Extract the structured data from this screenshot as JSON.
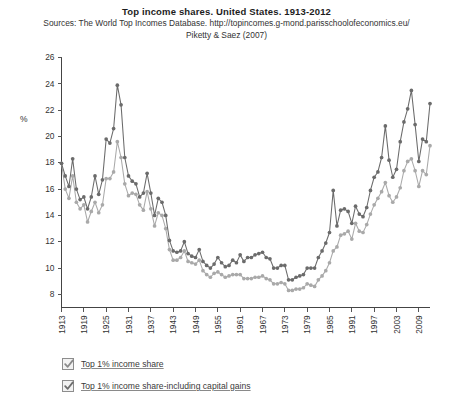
{
  "chart_data": {
    "type": "line",
    "title": "Top income shares. United States. 1913-2012",
    "subtitle_line1": "Sources: The World Top Incomes Database. http://topincomes.g-mond.parisschoolofeconomics.eu/",
    "subtitle_line2": "Piketty & Saez (2007)",
    "xlabel": "",
    "ylabel": "%",
    "xlim": [
      1913,
      2012
    ],
    "ylim": [
      7,
      26
    ],
    "yticks": [
      8,
      10,
      12,
      14,
      16,
      18,
      20,
      22,
      24,
      26
    ],
    "xticks": [
      1913,
      1919,
      1925,
      1931,
      1937,
      1943,
      1949,
      1955,
      1961,
      1967,
      1973,
      1979,
      1985,
      1991,
      1997,
      2003,
      2009
    ],
    "grid": false,
    "legend_position": "below",
    "x": [
      1913,
      1914,
      1915,
      1916,
      1917,
      1918,
      1919,
      1920,
      1921,
      1922,
      1923,
      1924,
      1925,
      1926,
      1927,
      1928,
      1929,
      1930,
      1931,
      1932,
      1933,
      1934,
      1935,
      1936,
      1937,
      1938,
      1939,
      1940,
      1941,
      1942,
      1943,
      1944,
      1945,
      1946,
      1947,
      1948,
      1949,
      1950,
      1951,
      1952,
      1953,
      1954,
      1955,
      1956,
      1957,
      1958,
      1959,
      1960,
      1961,
      1962,
      1963,
      1964,
      1965,
      1966,
      1967,
      1968,
      1969,
      1970,
      1971,
      1972,
      1973,
      1974,
      1975,
      1976,
      1977,
      1978,
      1979,
      1980,
      1981,
      1982,
      1983,
      1984,
      1985,
      1986,
      1987,
      1988,
      1989,
      1990,
      1991,
      1992,
      1993,
      1994,
      1995,
      1996,
      1997,
      1998,
      1999,
      2000,
      2001,
      2002,
      2003,
      2004,
      2005,
      2006,
      2007,
      2008,
      2009,
      2010,
      2011,
      2012
    ],
    "series": [
      {
        "name": "Top 1% income share-including capital gains",
        "color": "#6b6b6b",
        "values": [
          17.96,
          17.0,
          16.2,
          18.3,
          16.0,
          15.2,
          15.4,
          14.5,
          15.4,
          17.0,
          15.6,
          16.7,
          19.8,
          19.5,
          20.6,
          23.9,
          22.4,
          18.4,
          17.0,
          16.6,
          16.4,
          15.4,
          15.7,
          17.2,
          15.7,
          14.0,
          15.3,
          15.0,
          14.0,
          12.1,
          11.3,
          11.2,
          11.3,
          12.0,
          11.1,
          10.9,
          10.8,
          11.4,
          10.5,
          10.2,
          10.0,
          10.3,
          10.8,
          10.4,
          10.1,
          10.2,
          10.6,
          10.4,
          11.0,
          10.5,
          10.8,
          10.8,
          11.0,
          11.1,
          11.2,
          10.8,
          10.7,
          10.0,
          10.0,
          10.2,
          10.2,
          9.1,
          9.1,
          9.3,
          9.4,
          9.5,
          10.0,
          10.0,
          10.0,
          10.8,
          11.3,
          11.9,
          12.7,
          15.9,
          13.2,
          14.4,
          14.5,
          14.3,
          13.4,
          14.7,
          14.1,
          13.9,
          14.6,
          15.9,
          16.9,
          17.3,
          18.4,
          20.8,
          18.2,
          16.9,
          17.5,
          19.6,
          21.1,
          22.1,
          23.5,
          20.9,
          18.1,
          19.8,
          19.6,
          22.5
        ]
      },
      {
        "name": "Top 1% income share",
        "color": "#a9a9a9",
        "values": [
          17.96,
          16.0,
          15.3,
          17.0,
          15.0,
          14.5,
          14.8,
          13.5,
          14.3,
          15.0,
          14.2,
          14.8,
          16.8,
          16.8,
          17.3,
          19.6,
          18.4,
          16.4,
          15.5,
          15.7,
          15.6,
          14.8,
          14.4,
          15.8,
          14.5,
          13.2,
          14.2,
          14.0,
          13.0,
          11.4,
          10.6,
          10.6,
          10.8,
          11.3,
          10.5,
          10.4,
          10.3,
          10.6,
          9.8,
          9.5,
          9.3,
          9.6,
          9.7,
          9.5,
          9.3,
          9.4,
          9.5,
          9.5,
          9.5,
          9.2,
          9.2,
          9.2,
          9.3,
          9.3,
          9.4,
          9.2,
          9.1,
          8.8,
          8.8,
          8.9,
          8.8,
          8.3,
          8.3,
          8.4,
          8.4,
          8.5,
          8.8,
          8.7,
          8.6,
          9.1,
          9.4,
          9.8,
          10.4,
          11.3,
          11.6,
          12.5,
          12.6,
          12.8,
          12.2,
          13.4,
          12.8,
          12.7,
          13.3,
          14.1,
          14.8,
          15.3,
          15.8,
          16.5,
          15.5,
          15.0,
          15.4,
          16.1,
          17.4,
          18.1,
          18.3,
          17.4,
          16.2,
          17.4,
          17.1,
          19.3
        ]
      }
    ],
    "legend": [
      {
        "label": "Top 1% income share",
        "checked": true,
        "checkbox_color": "#8a8a8a"
      },
      {
        "label": "Top 1% income share-including capital gains",
        "checked": true,
        "checkbox_color": "#6d6d6d"
      }
    ]
  }
}
